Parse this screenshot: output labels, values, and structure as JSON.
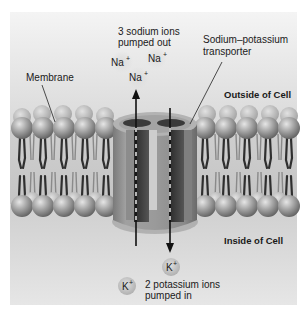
{
  "colors": {
    "page_bg": "#ffffff",
    "panel_top": "#f3f3f3",
    "panel_bottom": "#d6d6d6",
    "lipid_head_light": "#d9d9d9",
    "lipid_head_dark": "#6e6e6e",
    "tail_color": "#3a3a3a",
    "transporter_outer": "#8f8f8f",
    "transporter_dark": "#3c3c3c",
    "channel_light": "#c9c9c9",
    "ion_bubble": "#bdbdbd",
    "text": "#1a1a1a"
  },
  "labels": {
    "sodium_caption_line1": "3 sodium ions",
    "sodium_caption_line2": "pumped out",
    "transporter_line1": "Sodium–potassium",
    "transporter_line2": "transporter",
    "membrane": "Membrane",
    "outside": "Outside of Cell",
    "inside": "Inside of Cell",
    "potassium_caption_line1": "2 potassium ions",
    "potassium_caption_line2": "pumped in"
  },
  "ions": {
    "sodium": [
      {
        "symbol": "Na",
        "charge": "+"
      },
      {
        "symbol": "Na",
        "charge": "+"
      },
      {
        "symbol": "Na",
        "charge": "+"
      }
    ],
    "potassium": [
      {
        "symbol": "K",
        "charge": "+"
      },
      {
        "symbol": "K",
        "charge": "+"
      }
    ]
  },
  "arrows": {
    "sodium_direction": "up (inside → outside)",
    "potassium_direction": "down (outside → inside)"
  }
}
